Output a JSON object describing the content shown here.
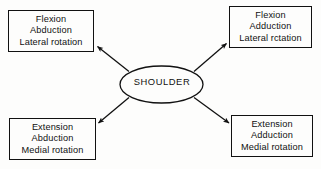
{
  "diagram": {
    "hub": {
      "label": "SHOULDER",
      "shape": "ellipse"
    },
    "colors": {
      "background": "#fdfdfc",
      "stroke": "#111111",
      "text": "#111111"
    },
    "nodes": [
      {
        "id": "top-left",
        "position": "top-left",
        "lines": [
          "Flexion",
          "Abduction",
          "Lateral rotation"
        ]
      },
      {
        "id": "top-right",
        "position": "top-right",
        "lines": [
          "Flexion",
          "Adduction",
          "Lateral rctation"
        ]
      },
      {
        "id": "bottom-left",
        "position": "bottom-left",
        "lines": [
          "Extension",
          "Abduction",
          "Medial rotation"
        ]
      },
      {
        "id": "bottom-right",
        "position": "bottom-right",
        "lines": [
          "Extension",
          "Adduction",
          "Medial rotation"
        ]
      }
    ],
    "connectors": [
      {
        "id": "hub-to-top-left",
        "from": "hub",
        "to": "top-left",
        "arrowhead": "at-target"
      },
      {
        "id": "hub-to-top-right",
        "from": "hub",
        "to": "top-right",
        "arrowhead": "at-target"
      },
      {
        "id": "hub-to-bottom-left",
        "from": "hub",
        "to": "bottom-left",
        "arrowhead": "at-target"
      },
      {
        "id": "hub-to-bottom-right",
        "from": "hub",
        "to": "bottom-right",
        "arrowhead": "at-target"
      }
    ]
  }
}
